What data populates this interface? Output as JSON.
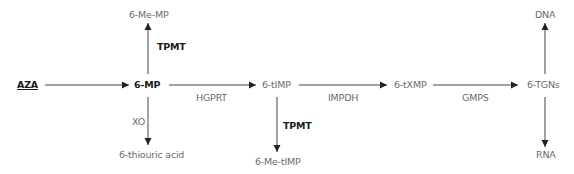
{
  "diagram": {
    "type": "metabolic-pathway",
    "nodes": {
      "aza": "AZA",
      "mp": "6-MP",
      "me_mp": "6-Me-MP",
      "thiouric": "6-thiouric acid",
      "timp": "6-tIMP",
      "me_timp": "6-Me-tIMP",
      "txmp": "6-tXMP",
      "tgns": "6-TGNs",
      "dna": "DNA",
      "rna": "RNA"
    },
    "enzymes": {
      "tpmt_1": "TPMT",
      "xo": "XO",
      "hgprt": "HGPRT",
      "tpmt_2": "TPMT",
      "impdh": "IMPDH",
      "gmps": "GMPS"
    },
    "edges": [
      {
        "from": "AZA",
        "to": "6-MP",
        "enzyme": ""
      },
      {
        "from": "6-MP",
        "to": "6-Me-MP",
        "enzyme": "TPMT"
      },
      {
        "from": "6-MP",
        "to": "6-thiouric acid",
        "enzyme": "XO"
      },
      {
        "from": "6-MP",
        "to": "6-tIMP",
        "enzyme": "HGPRT"
      },
      {
        "from": "6-tIMP",
        "to": "6-Me-tIMP",
        "enzyme": "TPMT"
      },
      {
        "from": "6-tIMP",
        "to": "6-tXMP",
        "enzyme": "IMPDH"
      },
      {
        "from": "6-tXMP",
        "to": "6-TGNs",
        "enzyme": "GMPS"
      },
      {
        "from": "6-TGNs",
        "to": "DNA",
        "enzyme": ""
      },
      {
        "from": "6-TGNs",
        "to": "RNA",
        "enzyme": ""
      }
    ],
    "colors": {
      "line": "#333333",
      "label": "#6b6b6b",
      "bold_label": "#1a1a1a",
      "background": "#ffffff"
    }
  }
}
